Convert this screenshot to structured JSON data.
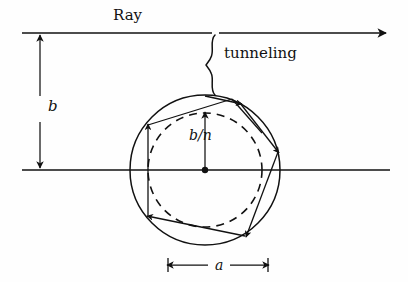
{
  "figure": {
    "kind": "optics-ray-diagram",
    "background_color": "#fefefe",
    "stroke_color": "#111111"
  },
  "labels": {
    "ray": "Ray",
    "tunneling": "tunneling",
    "impact_parameter": "b",
    "internal_radius": "b/n",
    "sphere_diameter": "a"
  },
  "geometry": {
    "sphere_center": {
      "x": 205,
      "y": 170
    },
    "outer_radius": 75,
    "inner_radius": 57,
    "top_ray_y": 33,
    "axis_y": 170,
    "entry_point": {
      "x": 205,
      "y": 96
    },
    "polygon_vertices": [
      {
        "x": 240,
        "y": 103
      },
      {
        "x": 278,
        "y": 152
      },
      {
        "x": 245,
        "y": 236
      },
      {
        "x": 148,
        "y": 215
      },
      {
        "x": 148,
        "y": 125
      }
    ]
  },
  "annotations": {
    "b_dimension": {
      "from_y": 35,
      "to_y": 169,
      "x": 40
    },
    "bn_arrow": {
      "from_y": 169,
      "to_y": 113,
      "x": 205
    },
    "a_dimension": {
      "from_x": 168,
      "to_x": 268,
      "y": 265
    },
    "brace_x": 212,
    "brace_top": 35,
    "brace_bottom": 95
  }
}
